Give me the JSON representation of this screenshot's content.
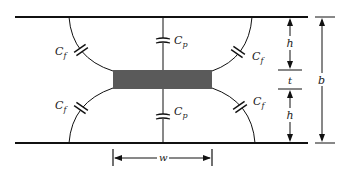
{
  "diagram": {
    "colors": {
      "line": "#111111",
      "conductor": "#5a5a5a",
      "background": "#ffffff"
    },
    "labels": {
      "cf": "C",
      "cf_sub": "f",
      "cp": "C",
      "cp_sub": "p",
      "h_top": "h",
      "h_bottom": "h",
      "t": "t",
      "b": "b",
      "w": "w"
    },
    "components": {
      "top_ground_plane": "ground plane",
      "bottom_ground_plane": "ground plane",
      "center_strip": "strip conductor",
      "capacitors": [
        "C_f top-left",
        "C_p top",
        "C_f top-right",
        "C_f bottom-left",
        "C_p bottom",
        "C_f bottom-right"
      ]
    }
  }
}
